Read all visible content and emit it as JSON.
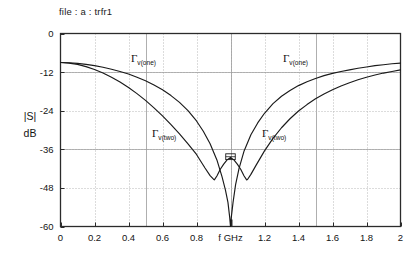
{
  "header": {
    "file_label": "file : a : trfr1"
  },
  "axes": {
    "y_title_line1": "|S|",
    "y_title_line2": "dB",
    "x_ticks": [
      "0",
      "0.2",
      "0.4",
      "0.6",
      "0.8",
      "f GHz",
      "1.2",
      "1.4",
      "1.6",
      "1.8",
      "2"
    ],
    "x_tick_values": [
      0,
      0.2,
      0.4,
      0.6,
      0.8,
      1.0,
      1.2,
      1.4,
      1.6,
      1.8,
      2.0
    ],
    "y_ticks": [
      "0",
      "-12",
      "-24",
      "-36",
      "-48",
      "-60"
    ],
    "y_tick_values": [
      0,
      -12,
      -24,
      -36,
      -48,
      -60
    ],
    "x_label_center": "f GHz"
  },
  "curve_labels": [
    {
      "name": "gamma-v-one-left",
      "gamma": "Γ",
      "sub": "v(one)",
      "x": 131,
      "y": 62
    },
    {
      "name": "gamma-v-one-right",
      "gamma": "Γ",
      "sub": "v(one)",
      "x": 283,
      "y": 62
    },
    {
      "name": "gamma-v-two-left",
      "gamma": "Γ",
      "sub": "v(two)",
      "x": 152,
      "y": 137
    },
    {
      "name": "gamma-v-two-right",
      "gamma": "Γ",
      "sub": "v(two)",
      "x": 262,
      "y": 137
    }
  ],
  "colors": {
    "frame": "#2b2b2b",
    "grid": "#b9b9b9",
    "curve": "#1a1a1a",
    "text": "#141414",
    "background": "#ffffff"
  },
  "chart_data": {
    "type": "line",
    "title": "file : a : trfr1",
    "xlabel": "f GHz",
    "ylabel": "|S| dB",
    "xlim": [
      0,
      2
    ],
    "ylim": [
      -60,
      0
    ],
    "grid": true,
    "legend": "inline-annotations",
    "xticks": [
      0,
      0.2,
      0.4,
      0.6,
      0.8,
      1.0,
      1.2,
      1.4,
      1.6,
      1.8,
      2.0
    ],
    "yticks": [
      0,
      -12,
      -24,
      -36,
      -48,
      -60
    ],
    "series": [
      {
        "name": "Γv(one)",
        "x": [
          0.0,
          0.05,
          0.1,
          0.15,
          0.2,
          0.25,
          0.3,
          0.35,
          0.4,
          0.45,
          0.5,
          0.55,
          0.6,
          0.65,
          0.7,
          0.75,
          0.8,
          0.84,
          0.88,
          0.92,
          0.95,
          0.97,
          0.985,
          0.995,
          1.0,
          1.005,
          1.015,
          1.03,
          1.05,
          1.08,
          1.12,
          1.16,
          1.2,
          1.25,
          1.3,
          1.35,
          1.4,
          1.45,
          1.5,
          1.55,
          1.6,
          1.65,
          1.7,
          1.75,
          1.8,
          1.85,
          1.9,
          1.95,
          2.0
        ],
        "values": [
          -9.0,
          -9.1,
          -9.3,
          -9.6,
          -10.0,
          -10.5,
          -11.1,
          -11.8,
          -12.6,
          -13.6,
          -14.7,
          -16.0,
          -17.5,
          -19.3,
          -21.4,
          -24.0,
          -27.2,
          -30.4,
          -34.3,
          -39.3,
          -44.5,
          -48.6,
          -52.5,
          -57.0,
          -60.0,
          -57.0,
          -52.5,
          -47.0,
          -42.0,
          -36.5,
          -31.5,
          -27.8,
          -24.8,
          -21.8,
          -19.5,
          -17.7,
          -16.2,
          -15.0,
          -14.0,
          -13.1,
          -12.4,
          -11.8,
          -11.3,
          -10.8,
          -10.4,
          -10.0,
          -9.7,
          -9.4,
          -9.2
        ]
      },
      {
        "name": "Γv(two)",
        "x": [
          0.0,
          0.05,
          0.1,
          0.15,
          0.2,
          0.25,
          0.3,
          0.35,
          0.4,
          0.45,
          0.5,
          0.55,
          0.6,
          0.65,
          0.7,
          0.75,
          0.8,
          0.85,
          0.88,
          0.9,
          0.905,
          0.92,
          0.94,
          0.96,
          0.98,
          1.0,
          1.02,
          1.04,
          1.06,
          1.08,
          1.095,
          1.1,
          1.12,
          1.15,
          1.2,
          1.25,
          1.3,
          1.35,
          1.4,
          1.45,
          1.5,
          1.55,
          1.6,
          1.65,
          1.7,
          1.75,
          1.8,
          1.85,
          1.9,
          1.95,
          2.0
        ],
        "values": [
          -9.0,
          -9.2,
          -9.6,
          -10.3,
          -11.2,
          -12.3,
          -13.6,
          -15.1,
          -16.8,
          -18.7,
          -20.8,
          -23.1,
          -25.6,
          -28.3,
          -31.2,
          -34.3,
          -37.6,
          -41.8,
          -44.2,
          -45.3,
          -45.5,
          -44.3,
          -42.2,
          -40.6,
          -39.3,
          -38.5,
          -39.3,
          -40.6,
          -42.2,
          -44.3,
          -45.5,
          -45.4,
          -43.8,
          -41.0,
          -36.5,
          -32.6,
          -29.3,
          -26.5,
          -24.1,
          -22.1,
          -20.3,
          -18.8,
          -17.5,
          -16.3,
          -15.3,
          -14.4,
          -13.6,
          -12.9,
          -12.3,
          -11.8,
          -11.3
        ]
      },
      {
        "name": "Γv(two)-center-box",
        "x": [
          0.975,
          1.025
        ],
        "values": [
          -37.6,
          -38.9
        ],
        "note": "small rectangular detail near center peak"
      }
    ]
  }
}
